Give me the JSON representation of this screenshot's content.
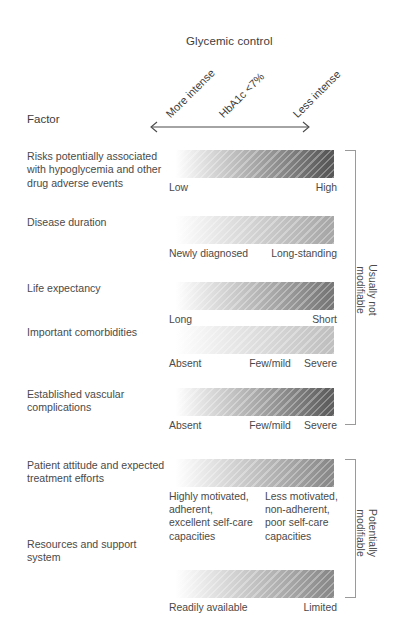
{
  "header": {
    "chart_title": "Glycemic control",
    "axis_left_label": "More intense",
    "axis_mid_label": "HbA1c <7%",
    "axis_right_label": "Less intense",
    "factor_column_header": "Factor"
  },
  "brackets": {
    "upper_label": "Usually not\nmodifiable",
    "lower_label": "Potentially\nmodifiable"
  },
  "rows": [
    {
      "factor": "Risks potentially associated with hypoglycemia and other drug adverse events",
      "scale_left": "Low",
      "scale_mid": "",
      "scale_right": "High",
      "gradient_end_color": "#585858"
    },
    {
      "factor": "Disease duration",
      "scale_left": "Newly diagnosed",
      "scale_mid": "",
      "scale_right": "Long-standing",
      "gradient_end_color": "#a8a8a8"
    },
    {
      "factor": "Life expectancy",
      "scale_left": "Long",
      "scale_mid": "",
      "scale_right": "Short",
      "gradient_end_color": "#787878"
    },
    {
      "factor": "Important comorbidities",
      "scale_left": "Absent",
      "scale_mid": "Few/mild",
      "scale_right": "Severe",
      "gradient_end_color": "#c0c0c0"
    },
    {
      "factor": "Established vascular complications",
      "scale_left": "Absent",
      "scale_mid": "Few/mild",
      "scale_right": "Severe",
      "gradient_end_color": "#5f5f5f"
    },
    {
      "factor": "Patient attitude and expected treatment efforts",
      "scale_left": "Highly motivated, adherent, excellent self-care capacities",
      "scale_mid": "",
      "scale_right": "Less motivated, non-adherent, poor self-care capacities",
      "gradient_end_color": "#8a8a8a"
    },
    {
      "factor": "Resources and support system",
      "scale_left": "Readily available",
      "scale_mid": "",
      "scale_right": "Limited",
      "gradient_end_color": "#8a8a8a"
    }
  ]
}
